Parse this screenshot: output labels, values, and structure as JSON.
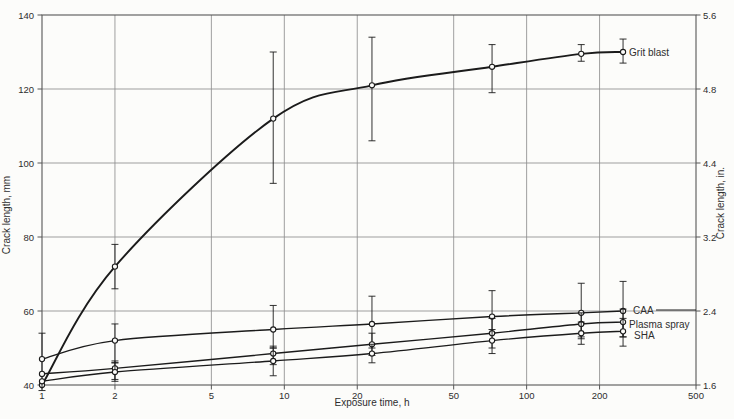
{
  "page": {
    "background": "#fcfcfa"
  },
  "chart_data": {
    "type": "line",
    "title": "",
    "xlabel": "Exposure time, h",
    "ylabel_left": "Crack length, mm",
    "ylabel_right": "Crack length, in.",
    "xscale": "log",
    "xlim": [
      1,
      500
    ],
    "ylim_left": [
      40,
      140
    ],
    "x_ticks": [
      1,
      2,
      5,
      10,
      20,
      50,
      100,
      200,
      500
    ],
    "y_ticks_left": [
      40,
      60,
      80,
      100,
      120,
      140
    ],
    "y_ticks_right": [
      "1.6",
      "2.4",
      "3.2",
      "4.4",
      "4.8",
      "5.6"
    ],
    "grid": true,
    "legend_position": "right-of-curve-ends",
    "x": [
      1,
      2,
      9,
      23,
      72,
      168,
      250
    ],
    "series": [
      {
        "name": "Grit blast",
        "values": [
          40,
          72,
          112,
          121,
          126,
          129.5,
          130
        ],
        "err": [
          null,
          [
            66,
            78
          ],
          [
            94.5,
            130
          ],
          [
            106,
            134
          ],
          [
            119,
            132
          ],
          [
            127.5,
            132
          ],
          [
            127,
            133.5
          ]
        ],
        "leader": false
      },
      {
        "name": "CAA",
        "values": [
          47,
          52,
          55,
          56.5,
          58.5,
          59.5,
          60
        ],
        "err": [
          [
            38.5,
            54
          ],
          [
            46,
            56.5
          ],
          [
            50,
            61.5
          ],
          [
            50,
            64
          ],
          [
            54,
            65.5
          ],
          [
            53,
            67.5
          ],
          [
            53,
            68
          ]
        ],
        "leader": true
      },
      {
        "name": "Plasma spray",
        "values": [
          43,
          44.5,
          48.5,
          51,
          54,
          56.5,
          57
        ],
        "err": [
          null,
          [
            41,
            46
          ],
          [
            45.5,
            50.5
          ],
          [
            48,
            54
          ],
          [
            50,
            58
          ],
          [
            52.5,
            59.5
          ],
          [
            53,
            60.5
          ]
        ],
        "leader": false
      },
      {
        "name": "SHA",
        "values": [
          41,
          43.5,
          46.5,
          48.5,
          52,
          54,
          54.5
        ],
        "err": [
          null,
          [
            41.5,
            46.5
          ],
          [
            42.5,
            50
          ],
          [
            46,
            51
          ],
          [
            48.5,
            55
          ],
          [
            51,
            57
          ],
          [
            50.5,
            58
          ]
        ],
        "leader": false
      }
    ],
    "colors": {
      "curve": "#1b1b1b",
      "grid": "#8f8f8f",
      "frame": "#565656",
      "text": "#2e2e2e",
      "marker_fill": "#fcfcfa"
    }
  }
}
